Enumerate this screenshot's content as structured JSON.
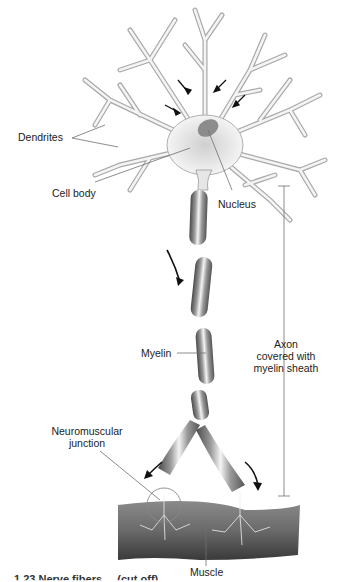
{
  "diagram": {
    "labels": {
      "dendrites": "Dendrites",
      "cell_body": "Cell body",
      "nucleus": "Nucleus",
      "axon_line1": "Axon",
      "axon_line2": "covered with",
      "axon_line3": "myelin sheath",
      "myelin": "Myelin",
      "nmj_line1": "Neuromuscular",
      "nmj_line2": "junction",
      "muscle": "Muscle"
    },
    "caption": "1.23 Nerve fibers ... (cut off)",
    "colors": {
      "line": "#6e6e6e",
      "dendrite_fill": "#f2f2f2",
      "dendrite_stroke": "#9a9a9a",
      "myelin_dark": "#5a5a5a",
      "myelin_light": "#d8d8d8",
      "muscle": "#707070",
      "arrow": "#111111"
    }
  }
}
